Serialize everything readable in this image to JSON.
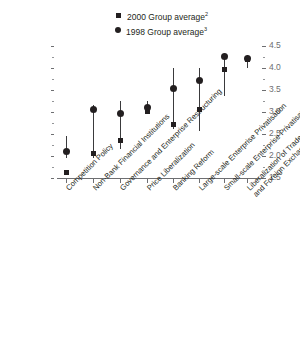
{
  "legend": {
    "position": "top-center",
    "items": [
      {
        "marker": "square",
        "label": "2000 Group average",
        "note": "2"
      },
      {
        "marker": "circle",
        "label": "1998 Group average",
        "note": "3"
      }
    ]
  },
  "chart_data": {
    "type": "scatter",
    "title": "",
    "xlabel": "",
    "ylabel": "",
    "ylim": [
      1.5,
      4.5
    ],
    "yticks": [
      "4.5",
      "4.0",
      "3.5",
      "3.0",
      "2.5",
      "2.0",
      "1.5"
    ],
    "ytick_values": [
      4.5,
      4.0,
      3.5,
      3.0,
      2.5,
      2.0,
      1.5
    ],
    "grid": false,
    "minor_ticks": true,
    "axis_position": "right",
    "categories": [
      "Competition Policy",
      "Non-Bank Financial Institutions",
      "Governance and Enterprise Restructuring",
      "Price Liberalization",
      "Banking Reform",
      "Large-scale Enterprise Privatisation",
      "Small-scale Enterprise Privatisation",
      "Liberalization of Trade and Foreign Exchange System"
    ],
    "category_lines": [
      [
        "Competition Policy"
      ],
      [
        "Non-Bank Financial Institutions"
      ],
      [
        "Governance and Enterprise Restructuring"
      ],
      [
        "Price Liberalization"
      ],
      [
        "Banking Reform"
      ],
      [
        "Large-scale Enterprise Privatisation"
      ],
      [
        "Small-scale Enterprise Privatisation"
      ],
      [
        "Liberalization of Trade",
        "and Foreign Exchange System"
      ]
    ],
    "series": [
      {
        "name": "2000 Group average",
        "marker": "square",
        "values": [
          1.62,
          2.05,
          2.35,
          3.0,
          2.7,
          3.05,
          3.95,
          4.18
        ]
      },
      {
        "name": "1998 Group average",
        "marker": "circle",
        "values": [
          2.1,
          3.05,
          2.95,
          3.1,
          3.52,
          3.72,
          4.25,
          4.22
        ]
      }
    ],
    "ranges": [
      {
        "category": "Competition Policy",
        "high": 2.45,
        "low": 1.95
      },
      {
        "category": "Non-Bank Financial Institutions",
        "high": 3.15,
        "low": 1.95
      },
      {
        "category": "Governance and Enterprise Restructuring",
        "high": 3.25,
        "low": 2.15
      },
      {
        "category": "Price Liberalization",
        "high": 3.25,
        "low": 2.95
      },
      {
        "category": "Banking Reform",
        "high": 4.0,
        "low": 2.6
      },
      {
        "category": "Large-scale Enterprise Privatisation",
        "high": 4.0,
        "low": 2.55
      },
      {
        "category": "Small-scale Enterprise Privatisation",
        "high": 4.25,
        "low": 3.35
      },
      {
        "category": "Liberalization of Trade and Foreign Exchange System",
        "high": 4.3,
        "low": 4.0
      }
    ],
    "colors": {
      "marker": "#231f20",
      "line": "#3a3a3c",
      "axis": "#6d6e71"
    }
  }
}
